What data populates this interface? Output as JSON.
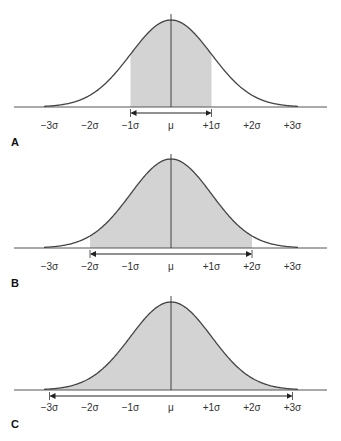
{
  "figure": {
    "title": "",
    "colors": {
      "curve": "#444444",
      "fill": "#d3d3d3",
      "axis": "#555555",
      "text": "#333333"
    },
    "tick_labels": [
      "−3σ",
      "−2σ",
      "−1σ",
      "μ",
      "+1σ",
      "+2σ",
      "+3σ"
    ],
    "panels": [
      {
        "label": "A",
        "shaded_range_sigma": [
          -1,
          1
        ],
        "arrow_from": "−1σ",
        "arrow_to": "+1σ"
      },
      {
        "label": "B",
        "shaded_range_sigma": [
          -2,
          2
        ],
        "arrow_from": "−2σ",
        "arrow_to": "+2σ"
      },
      {
        "label": "C",
        "shaded_range_sigma": [
          -3,
          3
        ],
        "arrow_from": "−3σ",
        "arrow_to": "+3σ"
      }
    ]
  },
  "chart_data": [
    {
      "type": "area",
      "title": "Normal distribution, shaded ±1σ",
      "panel": "A",
      "x_ticks": [
        "−3σ",
        "−2σ",
        "−1σ",
        "μ",
        "+1σ",
        "+2σ",
        "+3σ"
      ],
      "shaded_interval": [
        -1,
        1
      ],
      "grid": false
    },
    {
      "type": "area",
      "title": "Normal distribution, shaded ±2σ",
      "panel": "B",
      "x_ticks": [
        "−3σ",
        "−2σ",
        "−1σ",
        "μ",
        "+1σ",
        "+2σ",
        "+3σ"
      ],
      "shaded_interval": [
        -2,
        2
      ],
      "grid": false
    },
    {
      "type": "area",
      "title": "Normal distribution, shaded ±3σ",
      "panel": "C",
      "x_ticks": [
        "−3σ",
        "−2σ",
        "−1σ",
        "μ",
        "+1σ",
        "+2σ",
        "+3σ"
      ],
      "shaded_interval": [
        -3,
        3
      ],
      "grid": false
    }
  ]
}
